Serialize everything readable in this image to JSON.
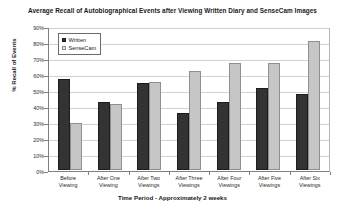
{
  "chart_data": {
    "type": "bar",
    "title": "Average Recall of Autobiographical Events after Viewing Written Diary and SenseCam Images",
    "xlabel": "Time Period - Approximately 2 weeks",
    "ylabel": "% Recall of Events",
    "categories": [
      "Before Viewing",
      "After One Viewing",
      "After Two Viewings",
      "After Three Viewings",
      "After Four Viewings",
      "After Five Viewings",
      "After Six Viewings"
    ],
    "category_lines": [
      [
        "Before",
        "Viewing"
      ],
      [
        "After One",
        "Viewing"
      ],
      [
        "After Two",
        "Viewings"
      ],
      [
        "After Three",
        "Viewings"
      ],
      [
        "After Four",
        "Viewings"
      ],
      [
        "After Five",
        "Viewings"
      ],
      [
        "After Six",
        "Viewings"
      ]
    ],
    "series": [
      {
        "name": "Written",
        "color": "#333333",
        "values": [
          58,
          43,
          55,
          36,
          43,
          52,
          48
        ]
      },
      {
        "name": "SenseCam",
        "color": "#c6c6c6",
        "values": [
          30,
          42,
          56,
          63,
          68,
          68,
          82
        ]
      }
    ],
    "ylim": [
      0,
      90
    ],
    "ytick_values": [
      0,
      10,
      20,
      30,
      40,
      50,
      60,
      70,
      80,
      90
    ],
    "ytick_labels": [
      "0%",
      "10%",
      "20%",
      "30%",
      "40%",
      "50%",
      "60%",
      "70%",
      "80%",
      "90%"
    ],
    "grid": true,
    "legend_position": "top-left-inside"
  },
  "legend": {
    "entries": [
      {
        "label": "Written",
        "swatch": "written"
      },
      {
        "label": "SenseCam",
        "swatch": "sensecam"
      }
    ]
  }
}
